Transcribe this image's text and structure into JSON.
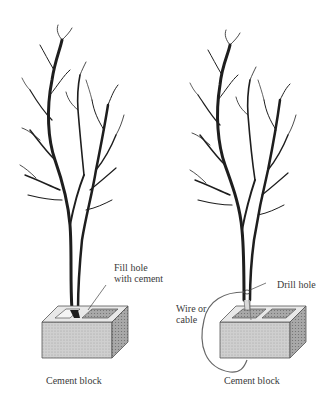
{
  "figure": {
    "left_panel": {
      "callout": [
        "Fill hole",
        "with cement"
      ],
      "caption": "Cement block"
    },
    "right_panel": {
      "callout_drill": "Drill hole",
      "callout_wire": [
        "Wire or",
        "cable"
      ],
      "caption": "Cement block"
    },
    "colors": {
      "ink": "#1a1a1a",
      "block_face": "#c9c9c9",
      "block_shadow": "#8a8a8a",
      "background": "#ffffff"
    }
  }
}
